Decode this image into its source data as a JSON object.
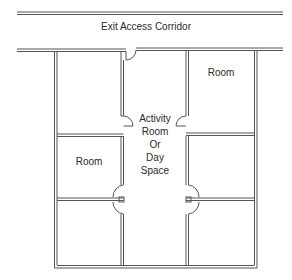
{
  "diagram": {
    "type": "floor-plan",
    "labels": {
      "corridor": "Exit Access Corridor",
      "room_top_right": "Room",
      "room_middle_left": "Room",
      "activity_line1": "Activity",
      "activity_line2": "Room",
      "activity_line3": "Or",
      "activity_line4": "Day",
      "activity_line5": "Space"
    },
    "colors": {
      "wall": "#555555",
      "background": "#ffffff",
      "text": "#2a2a2a"
    },
    "rooms": [
      {
        "id": "left-top",
        "label": ""
      },
      {
        "id": "left-middle",
        "label": "Room"
      },
      {
        "id": "left-bottom",
        "label": ""
      },
      {
        "id": "right-top",
        "label": "Room"
      },
      {
        "id": "right-middle",
        "label": ""
      },
      {
        "id": "right-bottom",
        "label": ""
      },
      {
        "id": "center",
        "label": "Activity Room Or Day Space"
      }
    ]
  }
}
